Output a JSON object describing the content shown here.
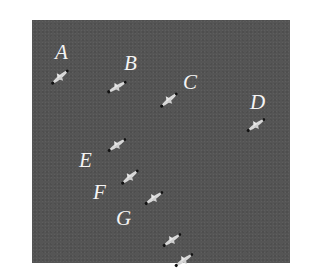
{
  "image": {
    "description": "Aerial view of a flock of birds flying over a dark gray background, with letter labels",
    "background_color": "#555555",
    "label_color": "#f4f4f4"
  },
  "labels": [
    {
      "id": "A",
      "text": "A",
      "x": 55,
      "y": 42
    },
    {
      "id": "B",
      "text": "B",
      "x": 124,
      "y": 53
    },
    {
      "id": "C",
      "text": "C",
      "x": 183,
      "y": 72
    },
    {
      "id": "D",
      "text": "D",
      "x": 250,
      "y": 92
    },
    {
      "id": "E",
      "text": "E",
      "x": 79,
      "y": 150
    },
    {
      "id": "F",
      "text": "F",
      "x": 93,
      "y": 182
    },
    {
      "id": "G",
      "text": "G",
      "x": 116,
      "y": 208
    }
  ],
  "birds": [
    {
      "id": "bird-1",
      "x": 48,
      "y": 70,
      "angle": -40
    },
    {
      "id": "bird-2",
      "x": 105,
      "y": 80,
      "angle": -30
    },
    {
      "id": "bird-3",
      "x": 157,
      "y": 93,
      "angle": -40
    },
    {
      "id": "bird-4",
      "x": 244,
      "y": 118,
      "angle": -35
    },
    {
      "id": "bird-5",
      "x": 105,
      "y": 138,
      "angle": -35
    },
    {
      "id": "bird-6",
      "x": 118,
      "y": 170,
      "angle": -40
    },
    {
      "id": "bird-7",
      "x": 142,
      "y": 191,
      "angle": -35
    },
    {
      "id": "bird-8",
      "x": 160,
      "y": 233,
      "angle": -35
    },
    {
      "id": "bird-9",
      "x": 172,
      "y": 253,
      "angle": -35
    }
  ]
}
